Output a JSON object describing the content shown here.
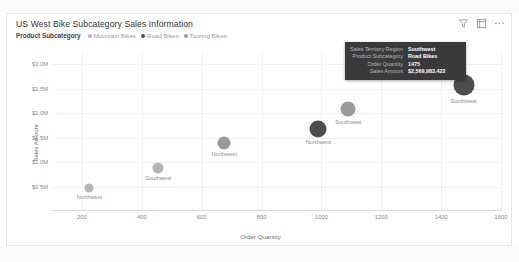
{
  "card": {
    "title": "US West Bike Subcategory Sales Information",
    "icons": [
      {
        "name": "filter-icon",
        "label": "Filters"
      },
      {
        "name": "focus-mode-icon",
        "label": "Focus mode"
      },
      {
        "name": "more-options-icon",
        "label": "More options"
      }
    ]
  },
  "legend": {
    "title": "Product Subcategory",
    "items": [
      {
        "label": "Mountain Bikes",
        "color": "#b5b5b5"
      },
      {
        "label": "Road Bikes",
        "color": "#4d4d4d"
      },
      {
        "label": "Touring Bikes",
        "color": "#9a9a9a"
      }
    ]
  },
  "tooltip": {
    "rows": [
      {
        "key": "Sales Territory Region",
        "value": "Southwest"
      },
      {
        "key": "Product Subcategory",
        "value": "Road Bikes"
      },
      {
        "key": "Order Quantity",
        "value": "1475"
      },
      {
        "key": "Sales Amount",
        "value": "$2,569,983.422"
      }
    ]
  },
  "chart_data": {
    "type": "scatter",
    "title": "US West Bike Subcategory Sales Information",
    "xlabel": "Order Quantity",
    "ylabel": "Sales Amount",
    "xlim": [
      100,
      1600
    ],
    "ylim": [
      0,
      3250000
    ],
    "xticks": [
      200,
      400,
      600,
      800,
      1000,
      1200,
      1400,
      1600
    ],
    "yticks": [
      500000,
      1000000,
      1500000,
      2000000,
      2500000,
      3000000
    ],
    "ytick_labels": [
      "$0.5M",
      "$1.0M",
      "$1.5M",
      "$2.0M",
      "$2.5M",
      "$3.0M"
    ],
    "xtick_labels": [
      "200",
      "400",
      "600",
      "800",
      "1000",
      "1200",
      "1400",
      "1600"
    ],
    "grid": true,
    "legend_position": "top-left",
    "series": [
      {
        "name": "Mountain Bikes",
        "color": "#b5b5b5",
        "points": [
          {
            "label": "Northwest",
            "x": 225,
            "y": 480000,
            "size": 9
          },
          {
            "label": "Southwest",
            "x": 455,
            "y": 880000,
            "size": 11
          }
        ]
      },
      {
        "name": "Touring Bikes",
        "color": "#9a9a9a",
        "points": [
          {
            "label": "Northwest",
            "x": 675,
            "y": 1400000,
            "size": 13
          },
          {
            "label": "Southwest",
            "x": 1090,
            "y": 2080000,
            "size": 15
          }
        ]
      },
      {
        "name": "Road Bikes",
        "color": "#4d4d4d",
        "points": [
          {
            "label": "Northwest",
            "x": 990,
            "y": 1680000,
            "size": 17
          },
          {
            "label": "Southwest",
            "x": 1475,
            "y": 2569983,
            "size": 21
          }
        ]
      }
    ]
  }
}
